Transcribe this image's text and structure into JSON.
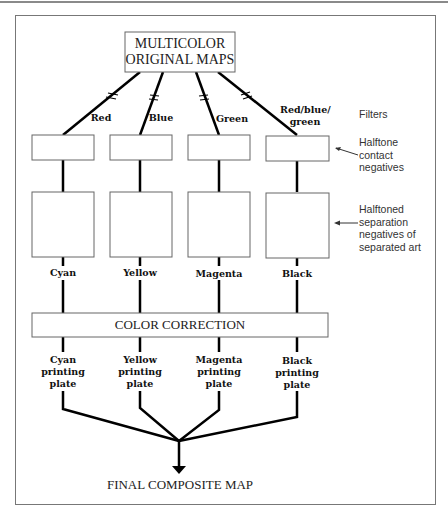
{
  "diagram": {
    "source": "MULTICOLOR\nORIGINAL MAPS",
    "source_lines": [
      "MULTICOLOR",
      "ORIGINAL MAPS"
    ],
    "filters": [
      "Red",
      "Blue",
      "Green",
      "Red/blue/ green"
    ],
    "filters_label": "Filters",
    "halftone_contact_label_lines": [
      "Halftone",
      "contact",
      "negatives"
    ],
    "separation_label_lines": [
      "Halftoned",
      "separation",
      "negatives of",
      "separated art"
    ],
    "separations": [
      "Cyan",
      "Yellow",
      "Magenta",
      "Black"
    ],
    "color_correction": "COLOR CORRECTION",
    "plates": [
      [
        "Cyan",
        "printing",
        "plate"
      ],
      [
        "Yellow",
        "printing",
        "plate"
      ],
      [
        "Magenta",
        "printing",
        "plate"
      ],
      [
        "Black",
        "printing",
        "plate"
      ]
    ],
    "result": "FINAL COMPOSITE MAP"
  }
}
